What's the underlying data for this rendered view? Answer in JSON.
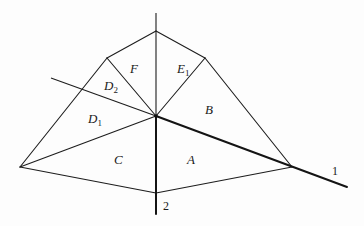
{
  "diagram": {
    "type": "region-partition",
    "vertices": {
      "center": [
        156,
        116
      ],
      "top": [
        156,
        31
      ],
      "upper_left": [
        107,
        58
      ],
      "upper_right": [
        205,
        58
      ],
      "left": [
        20,
        167
      ],
      "right": [
        292,
        167
      ],
      "bottom": [
        156,
        193
      ],
      "left_edge_intersection": [
        82,
        89
      ]
    },
    "regions": [
      {
        "id": "F",
        "letter": "F",
        "subscript": "",
        "pos": [
          130,
          62
        ]
      },
      {
        "id": "E1",
        "letter": "E",
        "subscript": "1",
        "pos": [
          177,
          62
        ]
      },
      {
        "id": "D2",
        "letter": "D",
        "subscript": "2",
        "pos": [
          104,
          79
        ]
      },
      {
        "id": "D1",
        "letter": "D",
        "subscript": "1",
        "pos": [
          88,
          112
        ]
      },
      {
        "id": "B",
        "letter": "B",
        "subscript": "",
        "pos": [
          205,
          103
        ]
      },
      {
        "id": "C",
        "letter": "C",
        "subscript": "",
        "pos": [
          114,
          153
        ]
      },
      {
        "id": "A",
        "letter": "A",
        "subscript": "",
        "pos": [
          187,
          153
        ]
      }
    ],
    "axes": [
      {
        "id": "1",
        "label": "1",
        "from": [
          51,
          78
        ],
        "to": [
          347,
          187
        ],
        "label_pos": [
          332,
          165
        ]
      },
      {
        "id": "2",
        "label": "2",
        "from": [
          156,
          13
        ],
        "to": [
          156,
          214
        ],
        "label_pos": [
          163,
          200
        ]
      }
    ]
  }
}
